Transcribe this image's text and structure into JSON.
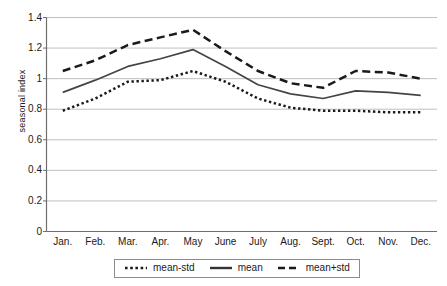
{
  "chart_data": {
    "type": "line",
    "title": "",
    "xlabel": "",
    "ylabel": "seasonal index",
    "categories": [
      "Jan.",
      "Feb.",
      "Mar.",
      "Apr.",
      "May",
      "June",
      "July",
      "Aug.",
      "Sept.",
      "Oct.",
      "Nov.",
      "Dec."
    ],
    "ylim": [
      0,
      1.4
    ],
    "yticks": [
      "0",
      "0.2",
      "0.4",
      "0.6",
      "0.8",
      "1",
      "1.2",
      "1.4"
    ],
    "ytick_values": [
      0,
      0.2,
      0.4,
      0.6,
      0.8,
      1,
      1.2,
      1.4
    ],
    "grid": "horizontal",
    "legend_position": "bottom",
    "series": [
      {
        "name": "mean-std",
        "style": "dotted",
        "color": "#1a1a1a",
        "values": [
          0.79,
          0.87,
          0.98,
          0.99,
          1.05,
          0.98,
          0.87,
          0.81,
          0.79,
          0.79,
          0.78,
          0.78
        ]
      },
      {
        "name": "mean",
        "style": "solid",
        "color": "#444444",
        "values": [
          0.91,
          0.99,
          1.08,
          1.13,
          1.19,
          1.08,
          0.96,
          0.9,
          0.87,
          0.92,
          0.91,
          0.89
        ]
      },
      {
        "name": "mean+std",
        "style": "dashed",
        "color": "#1a1a1a",
        "values": [
          1.05,
          1.12,
          1.22,
          1.27,
          1.32,
          1.18,
          1.05,
          0.97,
          0.94,
          1.05,
          1.04,
          1.0
        ]
      }
    ]
  },
  "legend": {
    "items": [
      {
        "label": "mean-std"
      },
      {
        "label": "mean"
      },
      {
        "label": "mean+std"
      }
    ]
  },
  "colors": {
    "axis": "#6e6e6e",
    "grid": "#b8b8b8",
    "text": "#1a1a1a",
    "background": "#ffffff"
  }
}
